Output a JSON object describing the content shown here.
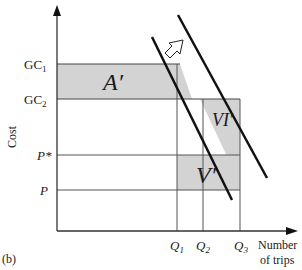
{
  "diagram": {
    "panel_label": "(b)",
    "y_axis_label": "Cost",
    "x_axis_label_line1": "Number",
    "x_axis_label_line2": "of trips",
    "y_ticks": {
      "gc1": "GC",
      "gc1_sub": "1",
      "gc2": "GC",
      "gc2_sub": "2",
      "pstar": "P*",
      "p": "P"
    },
    "x_ticks": {
      "q1": "Q",
      "q1_sub": "1",
      "q2": "Q",
      "q2_sub": "2",
      "q3": "Q",
      "q3_sub": "3"
    },
    "regions": {
      "a_prime": "A′",
      "vi_prime": "VI′",
      "v_prime": "V′"
    },
    "colors": {
      "shade": "#d3d3d3",
      "line": "#111111",
      "grid": "#555555"
    },
    "shift_arrow": "demand-shift-arrow"
  }
}
